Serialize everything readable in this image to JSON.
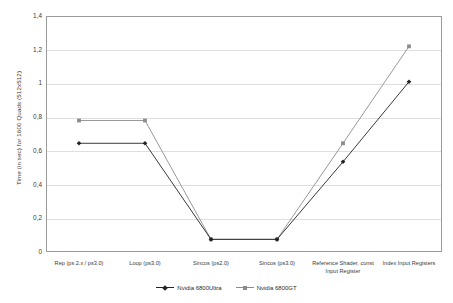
{
  "chart_data": {
    "type": "line",
    "title": "",
    "xlabel": "",
    "ylabel": "Time (in sec) for 1600 Quads (512x512)",
    "ylim": [
      0,
      1.4
    ],
    "ytick_labels": [
      "0",
      "0,2",
      "0,4",
      "0,6",
      "0,8",
      "1",
      "1,2",
      "1,4"
    ],
    "ytick_values": [
      0,
      0.2,
      0.4,
      0.6,
      0.8,
      1.0,
      1.2,
      1.4
    ],
    "grid": true,
    "legend_position": "bottom-center",
    "categories": [
      "Rep (ps 2.x / ps3.0)",
      "Loop (ps3.0)",
      "Sincos (ps2.0)",
      "Sincos (ps3.0)",
      "Reference Shader, const\nInput Register",
      "Index Input Registers"
    ],
    "series": [
      {
        "name": "Nvidia 6800Ultra",
        "color": "#222222",
        "marker": "diamond",
        "values": [
          0.645,
          0.645,
          0.075,
          0.075,
          0.535,
          1.01
        ]
      },
      {
        "name": "Nvidia 6800GT",
        "color": "#8c8c8c",
        "marker": "square",
        "values": [
          0.78,
          0.78,
          0.075,
          0.075,
          0.645,
          1.22
        ]
      }
    ]
  },
  "colors": {
    "frame": "#9a9a9a",
    "grid": "#dfdfdf",
    "text": "#3a3a3a",
    "background": "#ffffff"
  }
}
